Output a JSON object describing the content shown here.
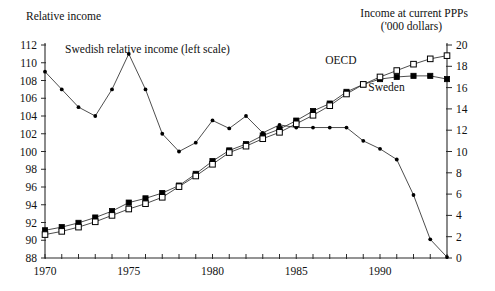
{
  "chart_data": {
    "type": "line",
    "title": "",
    "left_axis": {
      "label": "Relative income",
      "ticks": [
        88,
        90,
        92,
        94,
        96,
        98,
        100,
        102,
        104,
        106,
        108,
        110,
        112
      ],
      "ylim": [
        88,
        112
      ]
    },
    "right_axis": {
      "label_line1": "Income at current PPPs",
      "label_line2": "('000 dollars)",
      "ticks": [
        0,
        2,
        4,
        6,
        8,
        10,
        12,
        14,
        16,
        18,
        20
      ],
      "ylim": [
        0,
        20
      ]
    },
    "xlabel": "",
    "x": [
      1970,
      1971,
      1972,
      1973,
      1974,
      1975,
      1976,
      1977,
      1978,
      1979,
      1980,
      1981,
      1982,
      1983,
      1984,
      1985,
      1986,
      1987,
      1988,
      1989,
      1990,
      1991,
      1992,
      1993,
      1994
    ],
    "xticks_labeled": [
      1970,
      1975,
      1980,
      1985,
      1990
    ],
    "xlim": [
      1970,
      1994
    ],
    "grid": false,
    "annotations": [
      {
        "text": "Swedish relative income (left scale)",
        "x": 1971.2,
        "y": 111.6,
        "axis": "left"
      },
      {
        "text": "OECD",
        "x": 1988.6,
        "y": 18.6,
        "axis": "right"
      },
      {
        "text": "Sweden",
        "x": 1989.3,
        "y": 16.1,
        "axis": "right"
      }
    ],
    "series": [
      {
        "name": "Swedish relative income (left scale)",
        "axis": "left",
        "marker": "dot",
        "values": [
          109.0,
          107.0,
          105.0,
          104.0,
          107.0,
          111.0,
          107.0,
          102.0,
          100.0,
          101.0,
          103.5,
          102.6,
          104.0,
          102.1,
          103.0,
          102.6,
          102.6,
          102.6,
          102.6,
          102.6,
          102.6,
          102.6,
          102.6,
          102.6,
          102.6
        ]
      },
      {
        "name": "Sweden",
        "axis": "right",
        "marker": "filled-square",
        "values": [
          2.6,
          2.9,
          3.3,
          3.8,
          4.4,
          5.2,
          5.6,
          6.1,
          6.8,
          7.9,
          9.1,
          10.1,
          10.7,
          11.5,
          12.1,
          12.9,
          13.8,
          14.5,
          15.6,
          16.3,
          16.8,
          17.0,
          17.1,
          17.1,
          16.8
        ]
      },
      {
        "name": "OECD",
        "axis": "right",
        "marker": "open-square",
        "values": [
          2.2,
          2.5,
          2.9,
          3.4,
          4.0,
          4.6,
          5.1,
          5.7,
          6.7,
          7.7,
          8.8,
          9.9,
          10.5,
          11.2,
          11.8,
          12.6,
          13.4,
          14.3,
          15.4,
          16.3,
          17.0,
          17.6,
          18.2,
          18.7,
          19.0
        ]
      },
      {
        "name": "Swedish relative income decline (right scale segment)",
        "axis": "right",
        "marker": "dot",
        "values_sparse": [
          {
            "x": 1980,
            "y": 12.3
          },
          {
            "x": 1981,
            "y": 12.3
          },
          {
            "x": 1982,
            "y": 12.3
          },
          {
            "x": 1983,
            "y": 12.3
          },
          {
            "x": 1984,
            "y": 12.3
          },
          {
            "x": 1985,
            "y": 12.3
          },
          {
            "x": 1986,
            "y": 12.3
          },
          {
            "x": 1987,
            "y": 12.3
          },
          {
            "x": 1988,
            "y": 11.0
          },
          {
            "x": 1989,
            "y": 10.2
          },
          {
            "x": 1990,
            "y": 9.2
          },
          {
            "x": 1991,
            "y": 5.9
          },
          {
            "x": 1992,
            "y": 1.7
          },
          {
            "x": 1993,
            "y": 0.1
          }
        ]
      }
    ]
  },
  "meta": {
    "relative_income_points": [
      {
        "x": 1970,
        "y": 109.0
      },
      {
        "x": 1971,
        "y": 107.0
      },
      {
        "x": 1972,
        "y": 105.0
      },
      {
        "x": 1973,
        "y": 104.0
      },
      {
        "x": 1974,
        "y": 107.0
      },
      {
        "x": 1975,
        "y": 111.0
      },
      {
        "x": 1976,
        "y": 107.0
      },
      {
        "x": 1977,
        "y": 102.0
      },
      {
        "x": 1978,
        "y": 100.0
      },
      {
        "x": 1979,
        "y": 101.0
      },
      {
        "x": 1980,
        "y": 103.5
      },
      {
        "x": 1981,
        "y": 102.6
      },
      {
        "x": 1982,
        "y": 104.0
      },
      {
        "x": 1983,
        "y": 102.1
      },
      {
        "x": 1984,
        "y": 103.0
      },
      {
        "x": 1985,
        "y": 102.7
      },
      {
        "x": 1986,
        "y": 102.7
      },
      {
        "x": 1987,
        "y": 102.7
      },
      {
        "x": 1988,
        "y": 102.7
      },
      {
        "x": 1989,
        "y": 101.2
      },
      {
        "x": 1990,
        "y": 100.3
      },
      {
        "x": 1991,
        "y": 99.1
      },
      {
        "x": 1992,
        "y": 95.1
      },
      {
        "x": 1993,
        "y": 90.1
      },
      {
        "x": 1994,
        "y": 88.1
      }
    ]
  }
}
